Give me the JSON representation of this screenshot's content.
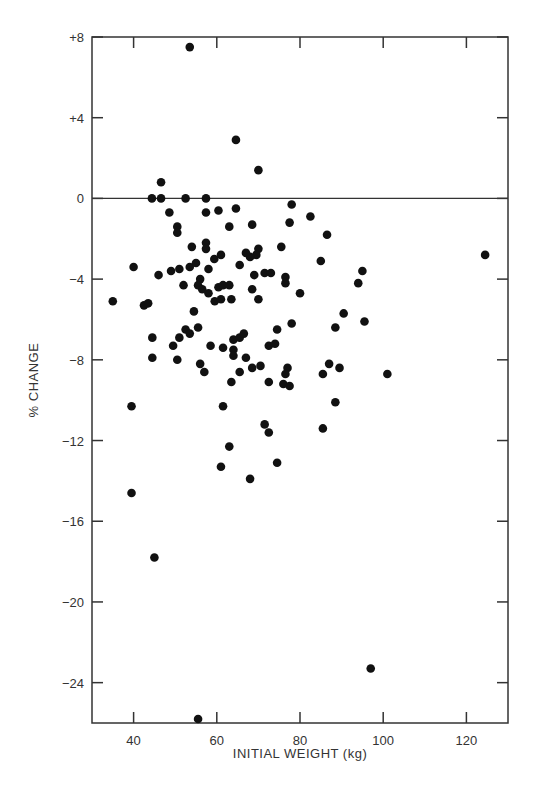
{
  "chart_data": {
    "type": "scatter",
    "title": "",
    "xlabel": "INITIAL WEIGHT (kg)",
    "ylabel": "% CHANGE",
    "xlim": [
      30,
      130
    ],
    "ylim": [
      -26,
      8
    ],
    "x_ticks": [
      40,
      60,
      80,
      100,
      120
    ],
    "x_tick_labels": [
      "40",
      "60",
      "80",
      "100",
      "120"
    ],
    "y_ticks": [
      8,
      4,
      0,
      -4,
      -8,
      -12,
      -16,
      -20,
      -24
    ],
    "y_tick_labels": [
      "+8",
      "+4",
      "0",
      "−4",
      "−8",
      "−12",
      "−16",
      "−20",
      "−24"
    ],
    "reference_line": {
      "y": 0,
      "style": "solid"
    },
    "grid": false,
    "legend": null,
    "marker_color": "#111111",
    "points": [
      [
        53.5,
        7.5
      ],
      [
        64.6,
        2.9
      ],
      [
        70.0,
        1.4
      ],
      [
        46.6,
        0.8
      ],
      [
        44.4,
        0.0
      ],
      [
        46.6,
        0.0
      ],
      [
        52.5,
        0.0
      ],
      [
        57.4,
        0.0
      ],
      [
        48.6,
        -0.7
      ],
      [
        57.4,
        -0.7
      ],
      [
        60.4,
        -0.6
      ],
      [
        64.6,
        -0.5
      ],
      [
        50.5,
        -1.4
      ],
      [
        50.5,
        -1.7
      ],
      [
        78.0,
        -0.3
      ],
      [
        77.5,
        -1.2
      ],
      [
        82.5,
        -0.9
      ],
      [
        54.0,
        -2.4
      ],
      [
        57.4,
        -2.2
      ],
      [
        57.4,
        -2.5
      ],
      [
        59.4,
        -3.0
      ],
      [
        61.0,
        -2.8
      ],
      [
        63.0,
        -1.4
      ],
      [
        68.5,
        -1.3
      ],
      [
        70.0,
        -2.5
      ],
      [
        69.5,
        -2.8
      ],
      [
        68.0,
        -2.9
      ],
      [
        75.5,
        -2.4
      ],
      [
        86.5,
        -1.8
      ],
      [
        85.0,
        -3.1
      ],
      [
        124.5,
        -2.8
      ],
      [
        40.0,
        -3.4
      ],
      [
        46.0,
        -3.8
      ],
      [
        49.0,
        -3.6
      ],
      [
        51.0,
        -3.5
      ],
      [
        53.5,
        -3.4
      ],
      [
        55.0,
        -3.2
      ],
      [
        58.0,
        -3.5
      ],
      [
        56.0,
        -4.0
      ],
      [
        55.5,
        -4.3
      ],
      [
        56.5,
        -4.5
      ],
      [
        52.0,
        -4.3
      ],
      [
        58.0,
        -4.7
      ],
      [
        60.4,
        -4.4
      ],
      [
        61.5,
        -4.3
      ],
      [
        59.5,
        -5.1
      ],
      [
        61.0,
        -5.0
      ],
      [
        63.5,
        -5.0
      ],
      [
        63.0,
        -4.3
      ],
      [
        65.5,
        -3.3
      ],
      [
        67.0,
        -2.7
      ],
      [
        69.0,
        -3.8
      ],
      [
        71.5,
        -3.7
      ],
      [
        73.0,
        -3.7
      ],
      [
        68.5,
        -4.5
      ],
      [
        70.0,
        -5.0
      ],
      [
        76.5,
        -3.9
      ],
      [
        76.5,
        -4.2
      ],
      [
        80.0,
        -4.7
      ],
      [
        95.0,
        -3.6
      ],
      [
        94.0,
        -4.2
      ],
      [
        90.5,
        -5.7
      ],
      [
        95.5,
        -6.1
      ],
      [
        78.0,
        -6.2
      ],
      [
        35.0,
        -5.1
      ],
      [
        42.5,
        -5.3
      ],
      [
        43.5,
        -5.2
      ],
      [
        44.5,
        -6.9
      ],
      [
        44.5,
        -7.9
      ],
      [
        49.5,
        -7.3
      ],
      [
        50.5,
        -8.0
      ],
      [
        52.5,
        -6.5
      ],
      [
        53.5,
        -6.7
      ],
      [
        54.5,
        -5.6
      ],
      [
        55.5,
        -6.4
      ],
      [
        51.0,
        -6.9
      ],
      [
        56.0,
        -8.2
      ],
      [
        57.0,
        -8.6
      ],
      [
        58.5,
        -7.3
      ],
      [
        61.5,
        -7.4
      ],
      [
        64.0,
        -7.0
      ],
      [
        64.0,
        -7.5
      ],
      [
        64.0,
        -7.8
      ],
      [
        65.5,
        -6.9
      ],
      [
        66.5,
        -6.7
      ],
      [
        67.0,
        -7.9
      ],
      [
        65.5,
        -8.6
      ],
      [
        68.5,
        -8.4
      ],
      [
        70.5,
        -8.3
      ],
      [
        72.5,
        -7.3
      ],
      [
        74.0,
        -7.2
      ],
      [
        74.5,
        -6.5
      ],
      [
        63.5,
        -9.1
      ],
      [
        72.5,
        -9.1
      ],
      [
        76.0,
        -9.2
      ],
      [
        77.5,
        -9.3
      ],
      [
        77.0,
        -8.4
      ],
      [
        76.5,
        -8.7
      ],
      [
        85.5,
        -8.7
      ],
      [
        87.0,
        -8.2
      ],
      [
        88.5,
        -6.4
      ],
      [
        89.5,
        -8.4
      ],
      [
        88.5,
        -10.1
      ],
      [
        101.0,
        -8.7
      ],
      [
        39.5,
        -10.3
      ],
      [
        61.5,
        -10.3
      ],
      [
        71.5,
        -11.2
      ],
      [
        72.5,
        -11.6
      ],
      [
        63.0,
        -12.3
      ],
      [
        85.5,
        -11.4
      ],
      [
        61.0,
        -13.3
      ],
      [
        74.5,
        -13.1
      ],
      [
        68.0,
        -13.9
      ],
      [
        39.5,
        -14.6
      ],
      [
        45.0,
        -17.8
      ],
      [
        97.0,
        -23.3
      ],
      [
        55.5,
        -25.8
      ]
    ]
  }
}
